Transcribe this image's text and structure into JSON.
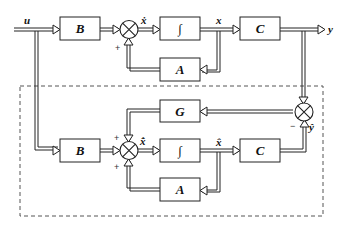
{
  "diagram": {
    "signals": {
      "input": "u",
      "output": "y",
      "state": "x",
      "state_dot": "ẋ",
      "est_state": "x̂",
      "est_state_dot": "x̂̇",
      "est_output": "ŷ"
    },
    "plant": {
      "blocks": [
        {
          "id": "B",
          "label": "B"
        },
        {
          "id": "int",
          "label": "∫"
        },
        {
          "id": "C",
          "label": "C"
        },
        {
          "id": "A",
          "label": "A"
        }
      ],
      "sum_signs": [
        "+"
      ]
    },
    "observer": {
      "blocks": [
        {
          "id": "G",
          "label": "G"
        },
        {
          "id": "B2",
          "label": "B"
        },
        {
          "id": "int2",
          "label": "∫"
        },
        {
          "id": "C2",
          "label": "C"
        },
        {
          "id": "A2",
          "label": "A"
        }
      ],
      "sum_signs": [
        "+",
        "+"
      ],
      "error_sum_signs": [
        "−"
      ]
    },
    "colors": {
      "line": "#222222",
      "dashed_box": "#555555"
    }
  }
}
